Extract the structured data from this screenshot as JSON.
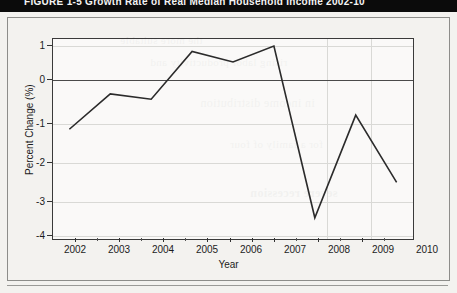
{
  "banner": {
    "title": "FIGURE  1-5    Growth Rate of Real Median Household Income 2002-10"
  },
  "bleed_text": [
    "the more suitable",
    "rising labor productivity and",
    "in income distribution",
    "for a family of four",
    "severe recession"
  ],
  "chart_data": {
    "type": "line",
    "title": "Growth Rate of Real Median Household Income 2002-10",
    "xlabel": "Year",
    "ylabel": "Percent Change (%)",
    "x": [
      2002,
      2003,
      2004,
      2005,
      2006,
      2007,
      2008,
      2009,
      2010
    ],
    "xtick_labels": [
      "2002",
      "2003",
      "2004",
      "2005",
      "2006",
      "2007",
      "2008",
      "2009",
      "2010"
    ],
    "ytick_labels": [
      "1",
      "0",
      "-1",
      "-2",
      "-3",
      "-4"
    ],
    "ytick_values": [
      1,
      0,
      -1,
      -2,
      -3,
      -4
    ],
    "values": [
      -1.1,
      -0.1,
      -0.25,
      1.1,
      0.8,
      1.25,
      -3.6,
      -0.7,
      -2.6
    ],
    "xlim": [
      2001.6,
      2010.4
    ],
    "ylim": [
      -4.2,
      1.45
    ],
    "grid": true,
    "legend": "none",
    "line_color": "#2b2b2b",
    "zero_line_color": "#4a4a4a",
    "grid_color": "#d9d9d6"
  }
}
